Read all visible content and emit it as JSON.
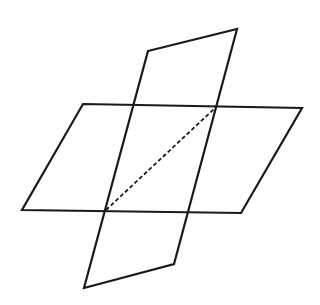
{
  "diagram": {
    "type": "intersecting-planes",
    "colors": {
      "background": "#ffffff",
      "stroke": "#1a1a1a"
    },
    "horizontal_plane": {
      "points": [
        [
          83,
          104
        ],
        [
          302,
          108
        ],
        [
          241,
          213
        ],
        [
          22,
          210
        ]
      ]
    },
    "vertical_plane": {
      "points": [
        [
          148,
          51
        ],
        [
          237,
          29
        ],
        [
          174,
          264
        ],
        [
          84,
          288
        ]
      ]
    },
    "intersection_line": {
      "from": [
        106,
        210
      ],
      "to": [
        214,
        109
      ],
      "style": "dashed"
    }
  }
}
